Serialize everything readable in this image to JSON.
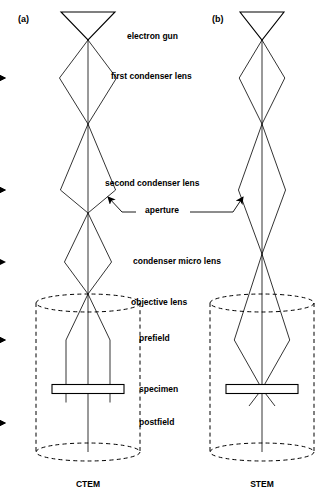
{
  "figure": {
    "title_visible": false,
    "background": "#ffffff",
    "ink": "#000000",
    "width": 325,
    "height": 496
  },
  "panels": [
    {
      "id": "panel-a",
      "tag": "(a)",
      "tag_x": 18,
      "tag_y": 22,
      "mode_label": "CTEM",
      "mode_x": 88,
      "mode_y": 487,
      "axis_x": 88,
      "axis_top": 40,
      "axis_bottom": 452,
      "gun": {
        "cx": 88,
        "top_y": 12,
        "apex_y": 40,
        "half_width": 27
      },
      "lenses": [
        {
          "name": "first-condenser-lens",
          "cy": 78,
          "rx": 46,
          "ry": 9.0
        },
        {
          "name": "second-condenser-lens",
          "cy": 190,
          "rx": 46,
          "ry": 9.0
        },
        {
          "name": "condenser-micro-lens",
          "cy": 262,
          "rx": 38,
          "ry": 8.0
        },
        {
          "name": "objective-prefield",
          "cy": 340,
          "rx": 42,
          "ry": 8.0
        },
        {
          "name": "objective-postfield",
          "cy": 423,
          "rx": 45,
          "ry": 8.5
        }
      ],
      "crossovers": [
        40,
        124,
        213,
        294,
        313
      ],
      "specimen": {
        "cx": 88,
        "cy": 389,
        "width": 72,
        "height": 9
      },
      "housing": {
        "cx": 88,
        "top_y": 303,
        "bottom_y": 452,
        "rx": 52,
        "ry": 9
      },
      "beam_half_width_at_specimen": 22,
      "beam_style": "parallel-illumination"
    },
    {
      "id": "panel-b",
      "tag": "(b)",
      "tag_x": 212,
      "tag_y": 22,
      "mode_label": "STEM",
      "mode_x": 262,
      "mode_y": 487,
      "axis_x": 262,
      "axis_top": 40,
      "axis_bottom": 452,
      "gun": {
        "cx": 262,
        "top_y": 12,
        "apex_y": 40,
        "half_width": 22
      },
      "lenses": [
        {
          "name": "first-condenser-lens",
          "cy": 78,
          "rx": 38,
          "ry": 8.0
        },
        {
          "name": "second-condenser-lens",
          "cy": 190,
          "rx": 38,
          "ry": 8.0
        },
        {
          "name": "objective-prefield",
          "cy": 340,
          "rx": 42,
          "ry": 8.0
        },
        {
          "name": "objective-postfield",
          "cy": 423,
          "rx": 45,
          "ry": 8.5
        }
      ],
      "crossovers": [
        40,
        124,
        254,
        389
      ],
      "specimen": {
        "cx": 262,
        "cy": 389,
        "width": 72,
        "height": 9
      },
      "housing": {
        "cx": 262,
        "top_y": 303,
        "bottom_y": 452,
        "rx": 52,
        "ry": 9
      },
      "beam_half_width_at_specimen": 0,
      "beam_style": "focused-probe"
    }
  ],
  "labels": [
    {
      "name": "label-electron-gun",
      "text": "electron gun",
      "x": 127,
      "y": 39,
      "anchor": "start"
    },
    {
      "name": "label-first-condenser-lens",
      "text": "first condenser lens",
      "x": 111,
      "y": 79,
      "anchor": "start"
    },
    {
      "name": "label-second-condenser-lens",
      "text": "second condenser lens",
      "x": 105,
      "y": 186,
      "anchor": "start"
    },
    {
      "name": "label-aperture",
      "text": "aperture",
      "x": 162,
      "y": 213,
      "anchor": "middle"
    },
    {
      "name": "label-condenser-micro-lens",
      "text": "condenser micro lens",
      "x": 133,
      "y": 264,
      "anchor": "start"
    },
    {
      "name": "label-objective-lens",
      "text": "objective lens",
      "x": 131,
      "y": 305,
      "anchor": "start"
    },
    {
      "name": "label-prefield",
      "text": "prefield",
      "x": 139,
      "y": 341,
      "anchor": "start"
    },
    {
      "name": "label-specimen",
      "text": "specimen",
      "x": 139,
      "y": 392,
      "anchor": "start"
    },
    {
      "name": "label-postfield",
      "text": "postfield",
      "x": 139,
      "y": 425,
      "anchor": "start"
    }
  ],
  "aperture_leaders": [
    {
      "name": "aperture-leader-left",
      "from_x": 136,
      "from_y": 212,
      "elbow_x": 122,
      "elbow_y": 212,
      "to_x": 108,
      "to_y": 197
    },
    {
      "name": "aperture-leader-right",
      "from_x": 190,
      "from_y": 212,
      "elbow_x": 233,
      "elbow_y": 212,
      "to_x": 243,
      "to_y": 197
    }
  ]
}
